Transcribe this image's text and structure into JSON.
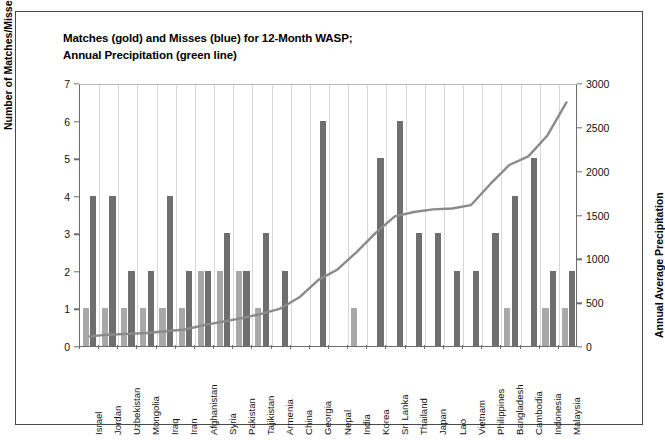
{
  "chart": {
    "title_line1": "Matches (gold) and Misses (blue) for 12-Month WASP;",
    "title_line2": "Annual Precipitation (green line)",
    "y_left_title": "Number of Matches/Misses",
    "y_right_title": "Annual Average Precipitation"
  },
  "chart_data": {
    "type": "bar",
    "title": "Matches (gold) and Misses (blue) for 12-Month WASP; Annual Precipitation (green line)",
    "xlabel": "",
    "ylabel": "Number of Matches/Misses",
    "y2label": "Annual Average Precipitation",
    "ylim": [
      0,
      7
    ],
    "y2lim": [
      0,
      3000
    ],
    "y_ticks": [
      "0",
      "1",
      "2",
      "3",
      "4",
      "5",
      "6",
      "7"
    ],
    "y2_ticks": [
      "0",
      "500",
      "1000",
      "1500",
      "2000",
      "2500",
      "3000"
    ],
    "grid": "vertical",
    "legend": "in-title",
    "categories": [
      "Israel",
      "Jordan",
      "Uzbekistan",
      "Mongolia",
      "Iraq",
      "Iran",
      "Afghanistan",
      "Syria",
      "Pakistan",
      "Tajikistan",
      "Armenia",
      "China",
      "Georgia",
      "Nepal",
      "India",
      "Korea",
      "Sri Lanka",
      "Thailand",
      "Japan",
      "Lao",
      "Vietnam",
      "Philippines",
      "Bangladesh",
      "Cambodia",
      "Indonesia",
      "Malaysia"
    ],
    "series": [
      {
        "name": "Matches (gold)",
        "color": "#a8a8a8",
        "values": [
          1,
          1,
          1,
          1,
          1,
          1,
          2,
          2,
          2,
          1,
          0,
          0,
          0,
          0,
          1,
          0,
          0,
          0,
          0,
          0,
          0,
          0,
          1,
          0,
          1,
          1
        ]
      },
      {
        "name": "Misses (blue)",
        "color": "#6f6f6f",
        "values": [
          4,
          4,
          2,
          2,
          4,
          2,
          2,
          3,
          2,
          3,
          2,
          0,
          6,
          0,
          0,
          5,
          6,
          3,
          3,
          2,
          2,
          3,
          4,
          5,
          2,
          2
        ]
      },
      {
        "name": "Annual Precipitation (green line)",
        "color": "#8a8a8a",
        "axis": "right",
        "values": [
          110,
          130,
          140,
          150,
          170,
          190,
          240,
          280,
          320,
          370,
          430,
          560,
          760,
          880,
          1080,
          1300,
          1490,
          1540,
          1570,
          1580,
          1620,
          1860,
          2080,
          2180,
          2420,
          2800
        ]
      }
    ]
  },
  "x_labels": [
    "Israel",
    "Jordan",
    "Uzbekistan",
    "Mongolia",
    "Iraq",
    "Iran",
    "Afghanistan",
    "Syria",
    "Pakistan",
    "Tajikistan",
    "Armenia",
    "China",
    "Georgia",
    "Nepal",
    "India",
    "Korea",
    "Sri Lanka",
    "Thailand",
    "Japan",
    "Lao",
    "Vietnam",
    "Philippines",
    "Bangladesh",
    "Cambodia",
    "Indonesia",
    "Malaysia"
  ]
}
